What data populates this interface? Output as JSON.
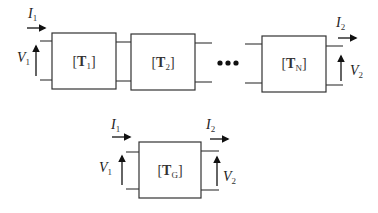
{
  "diagram": {
    "cascade": {
      "blocks": [
        {
          "open": "[",
          "symbol": "T",
          "subscript": "1",
          "close": "]"
        },
        {
          "open": "[",
          "symbol": "T",
          "subscript": "2",
          "close": "]"
        },
        {
          "open": "[",
          "symbol": "T",
          "subscript": "N",
          "close": "]"
        }
      ],
      "ellipsis": "•••",
      "input_current": {
        "symbol": "I",
        "subscript": "1"
      },
      "input_voltage": {
        "symbol": "V",
        "subscript": "1"
      },
      "output_current": {
        "symbol": "I",
        "subscript": "2"
      },
      "output_voltage": {
        "symbol": "V",
        "subscript": "2"
      }
    },
    "equivalent": {
      "block": {
        "open": "[",
        "symbol": "T",
        "subscript": "G",
        "close": "]"
      },
      "input_current": {
        "symbol": "I",
        "subscript": "1"
      },
      "input_voltage": {
        "symbol": "V",
        "subscript": "1"
      },
      "output_current": {
        "symbol": "I",
        "subscript": "2"
      },
      "output_voltage": {
        "symbol": "V",
        "subscript": "2"
      }
    },
    "colors": {
      "stroke": "#333333",
      "arrow": "#111111",
      "background": "#ffffff"
    }
  }
}
